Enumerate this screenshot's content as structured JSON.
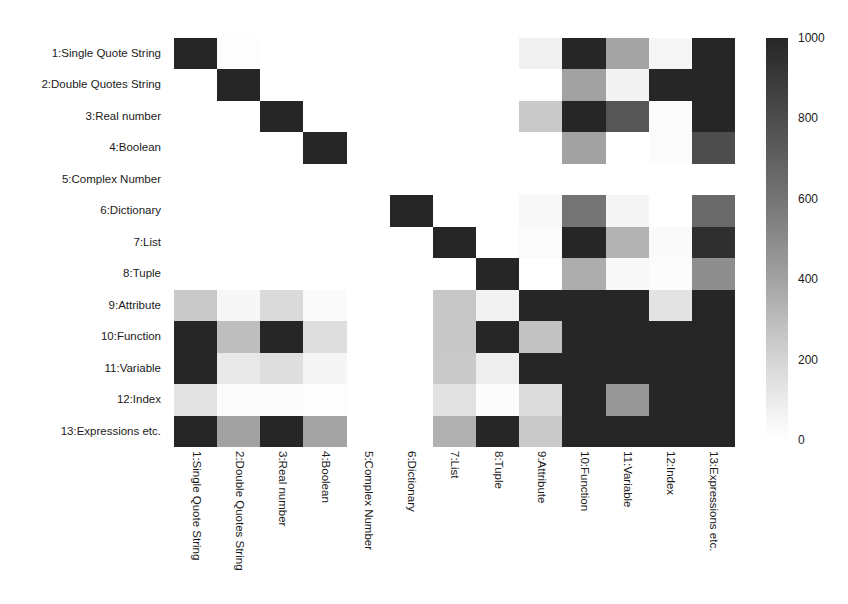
{
  "chart_data": {
    "type": "heatmap",
    "title": "",
    "xlabel": "",
    "ylabel": "",
    "grid": false,
    "legend_position": "right",
    "colorbar": {
      "label": "",
      "ticks": [
        0,
        200,
        400,
        600,
        800,
        1000
      ],
      "tick_labels": [
        "0",
        "200",
        "400",
        "600",
        "800",
        "1000"
      ],
      "vmin": 0,
      "vmax": 1000,
      "colormap": "greys_reversed",
      "low_color": "#ffffff",
      "high_color": "#262626"
    },
    "categories": [
      "1:Single Quote String",
      "2:Double Quotes String",
      "3:Real number",
      "4:Boolean",
      "5:Complex Number",
      "6:Dictionary",
      "7:List",
      "8:Tuple",
      "9:Attribute",
      "10:Function",
      "11:Variable",
      "12:Index",
      "13:Expressions etc."
    ],
    "x_tick_labels": [
      "1:Single Quote String",
      "2:Double Quotes String",
      "3:Real number",
      "4:Boolean",
      "5:Complex Number",
      "6:Dictionary",
      "7:List",
      "8:Tuple",
      "9:Attribute",
      "10:Function",
      "11:Variable",
      "12:Index",
      "13:Expressions etc."
    ],
    "y_tick_labels": [
      "1:Single Quote String",
      "2:Double Quotes String",
      "3:Real number",
      "4:Boolean",
      "5:Complex Number",
      "6:Dictionary",
      "7:List",
      "8:Tuple",
      "9:Attribute",
      "10:Function",
      "11:Variable",
      "12:Index",
      "13:Expressions etc."
    ],
    "values": [
      [
        1000,
        10,
        0,
        0,
        0,
        0,
        0,
        0,
        70,
        1000,
        420,
        40,
        1000
      ],
      [
        0,
        1000,
        0,
        0,
        0,
        0,
        0,
        0,
        0,
        430,
        55,
        1000,
        1000
      ],
      [
        0,
        0,
        1000,
        0,
        0,
        0,
        0,
        0,
        250,
        1000,
        780,
        20,
        1000
      ],
      [
        0,
        0,
        0,
        1000,
        0,
        0,
        0,
        0,
        0,
        430,
        0,
        20,
        820
      ],
      [
        0,
        0,
        0,
        0,
        0,
        0,
        0,
        0,
        0,
        0,
        0,
        0,
        0
      ],
      [
        0,
        0,
        0,
        0,
        0,
        1000,
        0,
        0,
        30,
        640,
        45,
        0,
        690
      ],
      [
        0,
        0,
        0,
        0,
        0,
        0,
        1000,
        0,
        20,
        1000,
        350,
        25,
        960
      ],
      [
        0,
        0,
        0,
        0,
        0,
        0,
        0,
        1000,
        0,
        380,
        30,
        15,
        520
      ],
      [
        250,
        35,
        170,
        25,
        0,
        0,
        260,
        60,
        1000,
        1000,
        1000,
        130,
        1000
      ],
      [
        1000,
        300,
        1000,
        150,
        0,
        0,
        260,
        1000,
        280,
        1000,
        1000,
        1000,
        1000
      ],
      [
        1000,
        100,
        150,
        45,
        0,
        0,
        250,
        80,
        1000,
        1000,
        1000,
        1000,
        1000
      ],
      [
        130,
        15,
        15,
        10,
        0,
        0,
        140,
        15,
        160,
        1000,
        480,
        1000,
        1000
      ],
      [
        1000,
        430,
        1000,
        420,
        0,
        0,
        360,
        1000,
        250,
        1000,
        1000,
        1000,
        1000
      ]
    ]
  }
}
